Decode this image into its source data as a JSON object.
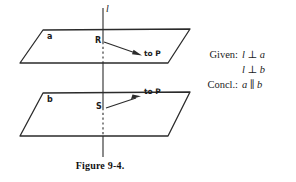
{
  "figure": {
    "caption": "Figure 9-4.",
    "line_label": "l",
    "upper_plane_label": "a",
    "lower_plane_label": "b",
    "upper_point_label": "R",
    "lower_point_label": "S",
    "upper_arrow_label": "to P",
    "lower_arrow_label": "to P",
    "ink_color": "#2b2b2b"
  },
  "proof": {
    "given_key": "Given:",
    "given_line_1_left": "l",
    "given_line_1_op": "⊥",
    "given_line_1_right": "a",
    "given_line_2_left": "l",
    "given_line_2_op": "⊥",
    "given_line_2_right": "b",
    "concl_key": "Concl.:",
    "concl_left": "a",
    "concl_op": "∥",
    "concl_right": "b"
  }
}
